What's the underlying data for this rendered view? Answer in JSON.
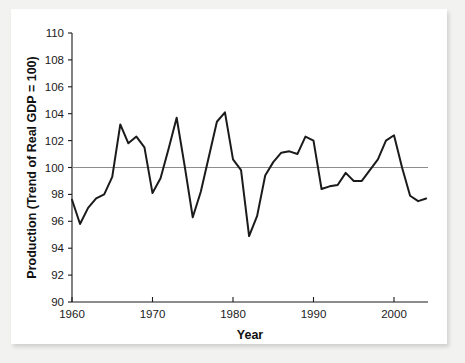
{
  "chart_data": {
    "type": "line",
    "title": "",
    "xlabel": "Year",
    "ylabel": "Production (Trend of Real GDP = 100)",
    "xlim": [
      1960,
      2004
    ],
    "ylim": [
      90,
      110
    ],
    "xticks": [
      1960,
      1970,
      1980,
      1990,
      2000
    ],
    "xtick_labels": [
      "1960",
      "1970",
      "1980",
      "1990",
      "2000"
    ],
    "yticks": [
      90,
      92,
      94,
      96,
      98,
      100,
      102,
      104,
      106,
      108,
      110
    ],
    "ytick_labels": [
      "90",
      "92",
      "94",
      "96",
      "98",
      "100",
      "102",
      "104",
      "106",
      "108",
      "110"
    ],
    "grid": false,
    "legend": null,
    "reference_lines": [
      {
        "axis": "y",
        "value": 100,
        "color": "#8d8d8d",
        "label": ""
      }
    ],
    "series": [
      {
        "name": "Production (Trend of Real GDP = 100)",
        "color": "#1b1b1b",
        "x": [
          1960,
          1961,
          1962,
          1963,
          1964,
          1965,
          1966,
          1967,
          1968,
          1969,
          1970,
          1971,
          1972,
          1973,
          1974,
          1975,
          1976,
          1977,
          1978,
          1979,
          1980,
          1981,
          1982,
          1983,
          1984,
          1985,
          1986,
          1987,
          1988,
          1989,
          1990,
          1991,
          1992,
          1993,
          1994,
          1995,
          1996,
          1997,
          1998,
          1999,
          2000,
          2001,
          2002,
          2003,
          2004
        ],
        "values": [
          97.6,
          95.8,
          97.0,
          97.7,
          98.0,
          99.3,
          103.2,
          101.8,
          102.3,
          101.5,
          98.1,
          99.2,
          101.4,
          103.7,
          100.1,
          96.3,
          98.2,
          100.8,
          103.4,
          104.1,
          100.6,
          99.8,
          94.9,
          96.4,
          99.4,
          100.4,
          101.1,
          101.2,
          101.0,
          102.3,
          102.0,
          98.4,
          98.6,
          98.7,
          99.6,
          99.0,
          99.0,
          99.8,
          100.6,
          102.0,
          102.4,
          100.0,
          97.9,
          97.5,
          97.7
        ]
      }
    ]
  },
  "figure": {
    "frame_color": "#ffffff",
    "background_color": "#f2f2f0",
    "axis_color": "#1a1a1a"
  }
}
